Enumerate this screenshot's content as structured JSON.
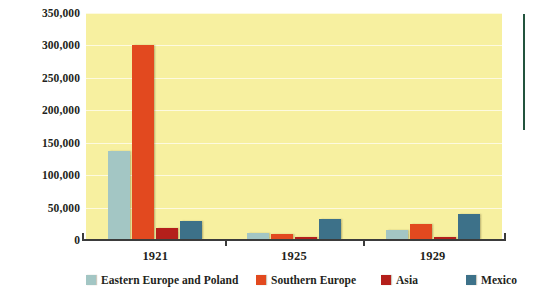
{
  "chart_data": {
    "type": "bar",
    "title": "",
    "xlabel": "",
    "ylabel": "",
    "categories": [
      "1921",
      "1925",
      "1929"
    ],
    "series": [
      {
        "name": "Eastern Europe and Poland",
        "color": "#a3c6c4",
        "values": [
          137000,
          11000,
          15000
        ]
      },
      {
        "name": "Southern Europe",
        "color": "#e2491f",
        "values": [
          300000,
          9000,
          24000
        ]
      },
      {
        "name": "Asia",
        "color": "#b41f1b",
        "values": [
          18000,
          4000,
          4000
        ]
      },
      {
        "name": "Mexico",
        "color": "#3d7189",
        "values": [
          30000,
          33000,
          40000
        ]
      }
    ],
    "ylim": [
      0,
      350000
    ],
    "ytick_labels": [
      "350,000",
      "300,000",
      "250,000",
      "200,000",
      "150,000",
      "100,000",
      "50,000",
      "0"
    ],
    "ytick_values": [
      350000,
      300000,
      250000,
      200000,
      150000,
      100000,
      50000,
      0
    ],
    "grid": true,
    "legend_position": "bottom",
    "plot_background": "#f7f0a0"
  }
}
